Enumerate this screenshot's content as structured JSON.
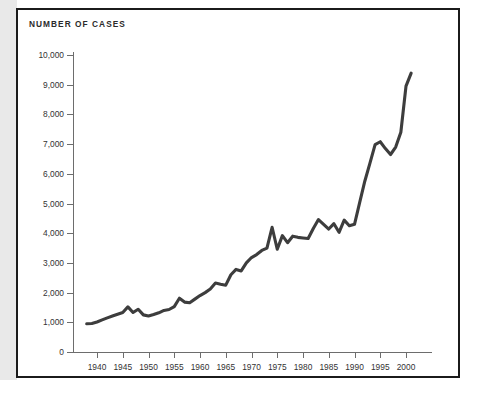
{
  "figure": {
    "title": "NUMBER OF CASES",
    "line_color": "#3d3d3d",
    "axis_color": "#6d6d6d",
    "frame_color": "#1b1b1b"
  },
  "chart_data": {
    "type": "line",
    "title": "NUMBER OF CASES",
    "xlabel": "",
    "ylabel": "",
    "xlim": [
      1938,
      2002
    ],
    "ylim": [
      0,
      10000
    ],
    "grid": false,
    "legend": null,
    "ytick_labels": [
      "0",
      "1,000",
      "2,000",
      "3,000",
      "4,000",
      "5,000",
      "6,000",
      "7,000",
      "8,000",
      "9,000",
      "10,000"
    ],
    "ytick_values": [
      0,
      1000,
      2000,
      3000,
      4000,
      5000,
      6000,
      7000,
      8000,
      9000,
      10000
    ],
    "xtick_labels": [
      "1940",
      "1945",
      "1950",
      "1955",
      "1960",
      "1965",
      "1970",
      "1975",
      "1980",
      "1985",
      "1990",
      "1995",
      "2000"
    ],
    "xtick_values": [
      1940,
      1945,
      1950,
      1955,
      1960,
      1965,
      1970,
      1975,
      1980,
      1985,
      1990,
      1995,
      2000
    ],
    "x": [
      1938,
      1939,
      1940,
      1941,
      1942,
      1943,
      1944,
      1945,
      1946,
      1947,
      1948,
      1949,
      1950,
      1951,
      1952,
      1953,
      1954,
      1955,
      1956,
      1957,
      1958,
      1959,
      1960,
      1961,
      1962,
      1963,
      1964,
      1965,
      1966,
      1967,
      1968,
      1969,
      1970,
      1971,
      1972,
      1973,
      1974,
      1975,
      1976,
      1977,
      1978,
      1979,
      1980,
      1981,
      1982,
      1983,
      1984,
      1985,
      1986,
      1987,
      1988,
      1989,
      1990,
      1991,
      1992,
      1993,
      1994,
      1995,
      1996,
      1997,
      1998,
      1999,
      2000,
      2001
    ],
    "values": [
      950,
      960,
      1010,
      1080,
      1150,
      1210,
      1270,
      1330,
      1520,
      1330,
      1440,
      1250,
      1210,
      1260,
      1320,
      1400,
      1430,
      1530,
      1810,
      1680,
      1660,
      1780,
      1900,
      2000,
      2120,
      2320,
      2280,
      2250,
      2600,
      2780,
      2730,
      3000,
      3180,
      3280,
      3420,
      3500,
      4200,
      3460,
      3920,
      3680,
      3900,
      3860,
      3840,
      3820,
      4160,
      4460,
      4300,
      4140,
      4320,
      4030,
      4440,
      4250,
      4300,
      5030,
      5750,
      6360,
      6980,
      7080,
      6850,
      6650,
      6900,
      7400,
      8950,
      9390
    ],
    "series": [
      {
        "name": "Number of cases",
        "values": [
          950,
          960,
          1010,
          1080,
          1150,
          1210,
          1270,
          1330,
          1520,
          1330,
          1440,
          1250,
          1210,
          1260,
          1320,
          1400,
          1430,
          1530,
          1810,
          1680,
          1660,
          1780,
          1900,
          2000,
          2120,
          2320,
          2280,
          2250,
          2600,
          2780,
          2730,
          3000,
          3180,
          3280,
          3420,
          3500,
          4200,
          3460,
          3920,
          3680,
          3900,
          3860,
          3840,
          3820,
          4160,
          4460,
          4300,
          4140,
          4320,
          4030,
          4440,
          4250,
          4300,
          5030,
          5750,
          6360,
          6980,
          7080,
          6850,
          6650,
          6900,
          7400,
          8950,
          9390
        ]
      }
    ]
  }
}
